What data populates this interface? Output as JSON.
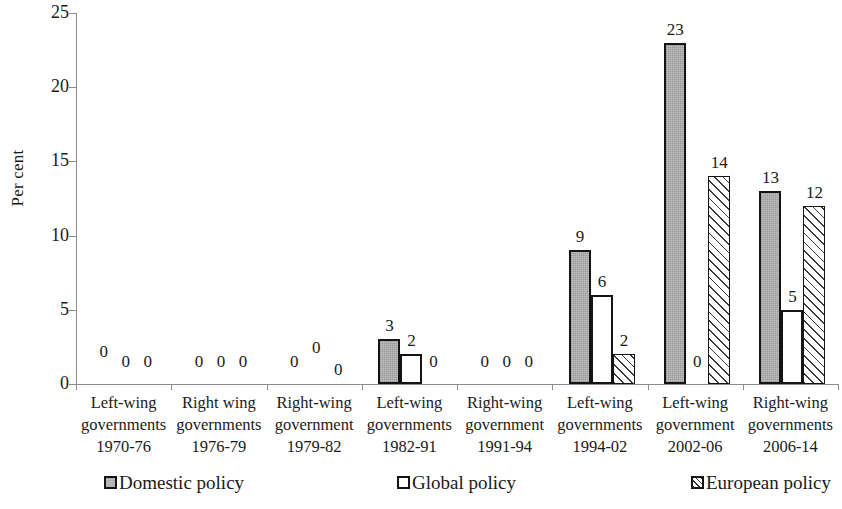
{
  "chart_data": {
    "type": "bar",
    "title": "",
    "xlabel": "",
    "ylabel": "Per cent",
    "ylim": [
      0,
      25
    ],
    "ytick_labels": [
      "0",
      "5",
      "10",
      "15",
      "20",
      "25"
    ],
    "ytick_values": [
      0,
      5,
      10,
      15,
      20,
      25
    ],
    "grid": false,
    "legend_position": "bottom",
    "categories": [
      "Left-wing governments 1970-76",
      "Right wing governments 1976-79",
      "Right-wing government 1979-82",
      "Left-wing governments 1982-91",
      "Right-wing government 1991-94",
      "Left-wing governments 1994-02",
      "Left-wing government 2002-06",
      "Right-wing governments 2006-14"
    ],
    "category_lines": [
      [
        "Left-wing",
        "governments",
        "1970-76"
      ],
      [
        "Right wing",
        "governments",
        "1976-79"
      ],
      [
        "Right-wing",
        "government",
        "1979-82"
      ],
      [
        "Left-wing",
        "governments",
        "1982-91"
      ],
      [
        "Right-wing",
        "government",
        "1991-94"
      ],
      [
        "Left-wing",
        "governments",
        "1994-02"
      ],
      [
        "Left-wing",
        "government",
        "2002-06"
      ],
      [
        "Right-wing",
        "governments",
        "2006-14"
      ]
    ],
    "series": [
      {
        "name": "Domestic policy",
        "key": "domestic",
        "fill": "#bfbfbf",
        "values": [
          0,
          0,
          0,
          3,
          0,
          9,
          23,
          13
        ],
        "labels": [
          "0",
          "0",
          "0",
          "3",
          "0",
          "9",
          "23",
          "13"
        ]
      },
      {
        "name": "Global policy",
        "key": "global",
        "fill": "#ffffff",
        "values": [
          0,
          0,
          0,
          2,
          0,
          6,
          0,
          5
        ],
        "labels": [
          "0",
          "0",
          "0",
          "2",
          "0",
          "6",
          "0",
          "5"
        ]
      },
      {
        "name": "European policy",
        "key": "european",
        "fill": "hatched",
        "values": [
          0,
          0,
          0,
          0,
          0,
          2,
          14,
          12
        ],
        "labels": [
          "0",
          "0",
          "0",
          "0",
          "0",
          "2",
          "14",
          "12"
        ]
      }
    ]
  },
  "axis": {
    "y_title": "Per cent"
  },
  "legend": {
    "items": [
      {
        "label": "Domestic policy",
        "key": "domestic"
      },
      {
        "label": "Global policy",
        "key": "global"
      },
      {
        "label": "European policy",
        "key": "european"
      }
    ]
  }
}
